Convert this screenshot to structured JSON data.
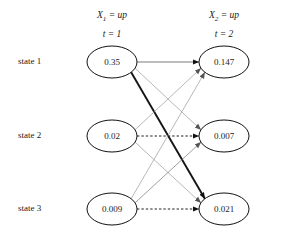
{
  "figure": {
    "columns": [
      {
        "id": "t1",
        "var_label": "X",
        "var_sub": "1",
        "eq": " = ",
        "value_label": "up",
        "time_label": "t = 1",
        "cx": 112,
        "cy_head": 20
      },
      {
        "id": "t2",
        "var_label": "X",
        "var_sub": "2",
        "eq": " = ",
        "value_label": "up",
        "time_label": "t = 2",
        "cx": 224,
        "cy_head": 20
      }
    ],
    "row_labels": [
      {
        "text": "state 1",
        "x": 18,
        "y": 62
      },
      {
        "text": "state 2",
        "x": 18,
        "y": 136
      },
      {
        "text": "state 3",
        "x": 18,
        "y": 209
      }
    ],
    "nodes": [
      {
        "id": "n11",
        "value": "0.35",
        "cx": 112,
        "cy": 62,
        "rx": 25,
        "ry": 16
      },
      {
        "id": "n21",
        "value": "0.02",
        "cx": 112,
        "cy": 136,
        "rx": 25,
        "ry": 16
      },
      {
        "id": "n31",
        "value": "0.009",
        "cx": 112,
        "cy": 209,
        "rx": 25,
        "ry": 16
      },
      {
        "id": "n12",
        "value": "0.147",
        "cx": 224,
        "cy": 62,
        "rx": 25,
        "ry": 16
      },
      {
        "id": "n22",
        "value": "0.007",
        "cx": 224,
        "cy": 136,
        "rx": 25,
        "ry": 16
      },
      {
        "id": "n32",
        "value": "0.021",
        "cx": 224,
        "cy": 209,
        "rx": 25,
        "ry": 16
      }
    ],
    "edges": [
      {
        "id": "e11",
        "from": "n11",
        "to": "n12",
        "style": "solid",
        "width": 0.7,
        "color": "#444444"
      },
      {
        "id": "e12",
        "from": "n11",
        "to": "n22",
        "style": "solid",
        "width": 0.7,
        "color": "#9a9a9a"
      },
      {
        "id": "e13",
        "from": "n11",
        "to": "n32",
        "style": "solid",
        "width": 1.9,
        "color": "#151515"
      },
      {
        "id": "e21",
        "from": "n21",
        "to": "n12",
        "style": "solid",
        "width": 0.7,
        "color": "#9a9a9a"
      },
      {
        "id": "e22",
        "from": "n21",
        "to": "n22",
        "style": "dashed",
        "width": 1.0,
        "color": "#222222"
      },
      {
        "id": "e23",
        "from": "n21",
        "to": "n32",
        "style": "solid",
        "width": 0.7,
        "color": "#9a9a9a"
      },
      {
        "id": "e31",
        "from": "n31",
        "to": "n12",
        "style": "solid",
        "width": 0.7,
        "color": "#9a9a9a"
      },
      {
        "id": "e32",
        "from": "n31",
        "to": "n22",
        "style": "solid",
        "width": 0.7,
        "color": "#777777"
      },
      {
        "id": "e33",
        "from": "n31",
        "to": "n32",
        "style": "dashed",
        "width": 1.0,
        "color": "#222222"
      }
    ],
    "colors": {
      "node_stroke": "#111111",
      "background": "#ffffff",
      "text": "#1a1a1a"
    }
  }
}
